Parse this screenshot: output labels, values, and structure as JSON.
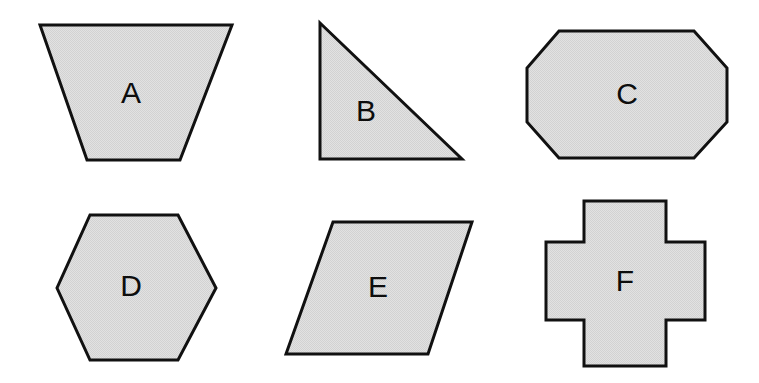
{
  "figure": {
    "background_color": "#ffffff",
    "canvas": {
      "width": 759,
      "height": 383
    }
  },
  "style": {
    "fill_color": "#dcdcdc",
    "stroke_color": "#111111",
    "stroke_width": 3,
    "label_color": "#0d0d0d",
    "label_font_size": 30
  },
  "shapes": [
    {
      "id": "A",
      "label": "A",
      "name": "trapezoid",
      "row": 1,
      "column": 1,
      "points": "40,25 232,25 180,160 87,160",
      "label_x": 131,
      "label_y": 95
    },
    {
      "id": "B",
      "label": "B",
      "name": "right-triangle",
      "row": 1,
      "column": 2,
      "points": "320,23 462,159 320,159",
      "label_x": 366,
      "label_y": 113
    },
    {
      "id": "C",
      "label": "C",
      "name": "octagon",
      "row": 1,
      "column": 3,
      "points": "559,31 694,31 727,68 727,122 694,158 559,158 527,122 527,68",
      "label_x": 627,
      "label_y": 96
    },
    {
      "id": "D",
      "label": "D",
      "name": "hexagon",
      "row": 2,
      "column": 1,
      "points": "90,215 178,215 216,288 178,360 90,360 57,288",
      "label_x": 131,
      "label_y": 288
    },
    {
      "id": "E",
      "label": "E",
      "name": "parallelogram",
      "row": 2,
      "column": 2,
      "points": "333,222 472,222 428,354 286,354",
      "label_x": 378,
      "label_y": 289
    },
    {
      "id": "F",
      "label": "F",
      "name": "cross",
      "row": 2,
      "column": 3,
      "points": "584,201 666,201 666,242 705,242 705,320 666,320 666,366 584,366 584,320 546,320 546,242 584,242",
      "label_x": 625,
      "label_y": 283
    }
  ]
}
